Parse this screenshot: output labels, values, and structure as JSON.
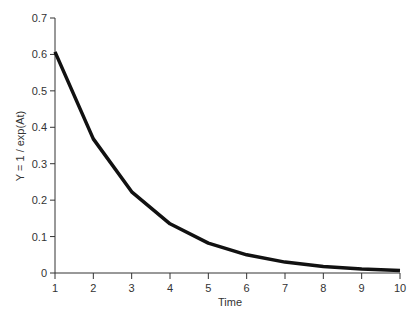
{
  "chart_data": {
    "type": "line",
    "title": "",
    "xlabel": "Time",
    "ylabel": "Y = 1 / exp(At)",
    "xlim": [
      1,
      10
    ],
    "ylim": [
      0,
      0.7
    ],
    "x_ticks": [
      "1",
      "2",
      "3",
      "4",
      "5",
      "6",
      "7",
      "8",
      "9",
      "10"
    ],
    "y_ticks": [
      "0",
      "0.1",
      "0.2",
      "0.3",
      "0.4",
      "0.5",
      "0.6",
      "0.7"
    ],
    "grid": false,
    "legend": null,
    "x": [
      1,
      2,
      3,
      4,
      5,
      6,
      7,
      8,
      9,
      10
    ],
    "series": [
      {
        "name": "Y",
        "color": "#111111",
        "values": [
          0.607,
          0.368,
          0.223,
          0.135,
          0.082,
          0.05,
          0.03,
          0.018,
          0.011,
          0.007
        ]
      }
    ]
  }
}
